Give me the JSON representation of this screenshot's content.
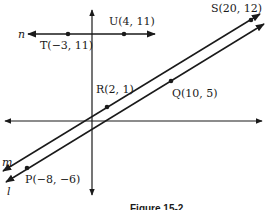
{
  "figure": {
    "caption": "Figure 15-2",
    "axes": {
      "x_axis": "x",
      "y_axis": "y"
    },
    "lines": [
      {
        "name": "n",
        "label": "n",
        "through": [
          "T",
          "U"
        ],
        "orientation": "horizontal"
      },
      {
        "name": "m",
        "label": "m",
        "through": [
          "R",
          "S"
        ]
      },
      {
        "name": "l",
        "label": "l",
        "through": [
          "P",
          "Q"
        ]
      }
    ],
    "points": {
      "T": {
        "name": "T",
        "coords": "(−3, 11)",
        "label": "T(−3, 11)"
      },
      "U": {
        "name": "U",
        "coords": "(4, 11)",
        "label": "U(4, 11)"
      },
      "S": {
        "name": "S",
        "coords": "(20, 12)",
        "label": "S(20, 12)"
      },
      "R": {
        "name": "R",
        "coords": "(2, 1)",
        "label": "R(2, 1)"
      },
      "Q": {
        "name": "Q",
        "coords": "(10, 5)",
        "label": "Q(10, 5)"
      },
      "P": {
        "name": "P",
        "coords": "(−8, −6)",
        "label": "P(−8, −6)"
      }
    },
    "line_color": "#1a1a1a"
  }
}
